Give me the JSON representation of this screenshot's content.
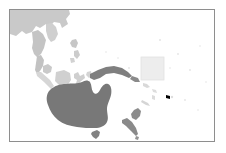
{
  "figure": {
    "kind": "map-thumbnail",
    "region_title": "Oceania and Australasia",
    "background_color": "#ffffff",
    "frame": {
      "border_color": "#8e8e8e",
      "border_width_px": 1,
      "left_px": 9,
      "top_px": 9,
      "width_px": 206,
      "height_px": 133
    },
    "colors": {
      "ocean": "#ffffff",
      "land_dark": "#7b7b7b",
      "land_mid": "#9a9a9a",
      "land_light": "#c9c9c9",
      "land_faint": "#dcdcdc",
      "highlight_fill": "#ededed",
      "highlight_stroke": "#e2e2e2"
    },
    "highlight": {
      "label": "highlight-region-box",
      "shape": "square",
      "left_px": 131,
      "top_px": 47,
      "width_px": 23,
      "height_px": 23,
      "fill": "#ededed",
      "stroke": "#e2e2e2"
    },
    "landmasses": [
      {
        "name": "continental-asia",
        "shade": "land_light"
      },
      {
        "name": "indochina-peninsula",
        "shade": "land_light"
      },
      {
        "name": "philippines",
        "shade": "land_light"
      },
      {
        "name": "borneo",
        "shade": "land_faint"
      },
      {
        "name": "sumatra",
        "shade": "land_faint"
      },
      {
        "name": "java",
        "shade": "land_faint"
      },
      {
        "name": "sulawesi",
        "shade": "land_faint"
      },
      {
        "name": "new-guinea",
        "shade": "land_dark"
      },
      {
        "name": "australia",
        "shade": "land_dark"
      },
      {
        "name": "tasmania",
        "shade": "land_dark"
      },
      {
        "name": "new-zealand-north-island",
        "shade": "land_mid"
      },
      {
        "name": "new-zealand-south-island",
        "shade": "land_mid"
      },
      {
        "name": "new-caledonia",
        "shade": "land_faint"
      },
      {
        "name": "vanuatu",
        "shade": "land_faint"
      },
      {
        "name": "fiji",
        "shade": "land_faint"
      },
      {
        "name": "solomon-islands",
        "shade": "land_faint"
      }
    ]
  }
}
